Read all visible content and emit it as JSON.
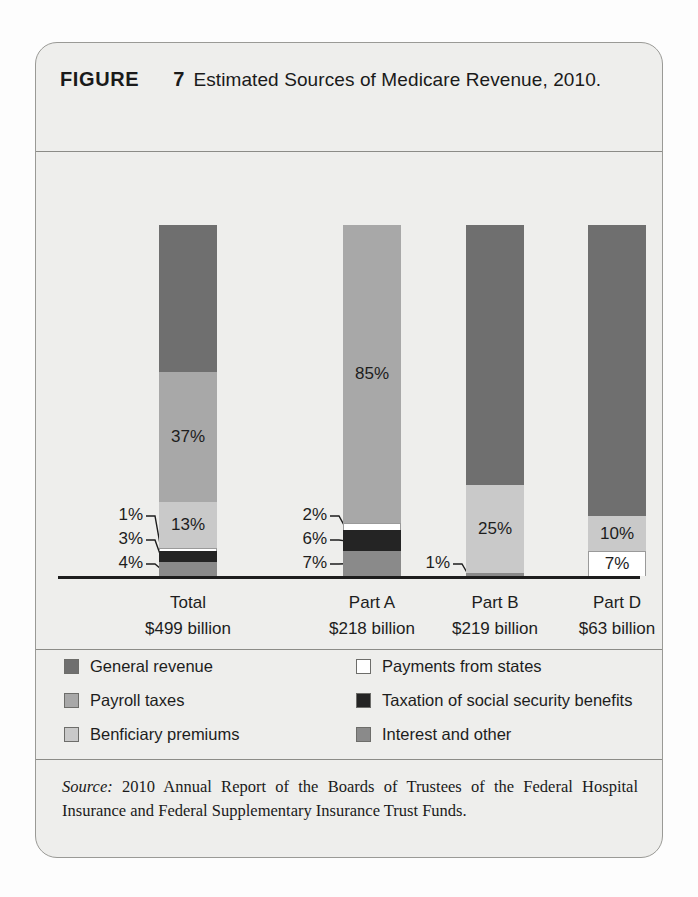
{
  "figure": {
    "label": "FIGURE",
    "number": "7",
    "title": "Estimated Sources of Medicare Revenue, 2010."
  },
  "source": {
    "prefix": "Source:",
    "text": " 2010 Annual Report of the Boards of Trustees of the Federal Hospital Insurance and Federal Supplementary Insurance Trust Funds."
  },
  "colors": {
    "general_revenue": "#6f6f6f",
    "payroll_taxes": "#a8a8a8",
    "beneficiary_premiums": "#c9c9c9",
    "payments_from_states": "#ffffff",
    "taxation_ss_benefits": "#242424",
    "interest_and_other": "#8a8a8a",
    "card_bg": "#eeeeec",
    "axis": "#1d1d1d"
  },
  "legend": {
    "items": [
      {
        "label": "General revenue",
        "color_key": "general_revenue"
      },
      {
        "label": "Payroll taxes",
        "color_key": "payroll_taxes"
      },
      {
        "label": "Benficiary premiums",
        "color_key": "beneficiary_premiums"
      },
      {
        "label": "Payments from states",
        "color_key": "payments_from_states"
      },
      {
        "label": "Taxation of social security benefits",
        "color_key": "taxation_ss_benefits"
      },
      {
        "label": "Interest and other",
        "color_key": "interest_and_other"
      }
    ]
  },
  "chart_data": {
    "type": "bar",
    "subtype": "stacked-100-percent",
    "title": "Estimated Sources of Medicare Revenue, 2010.",
    "xlabel": "",
    "ylabel": "Share of revenue (%)",
    "ylim": [
      0,
      100
    ],
    "grid": false,
    "legend_position": "below-plot",
    "units": "percent",
    "categories": [
      "Total",
      "Part A",
      "Part B",
      "Part D"
    ],
    "category_sublabels": [
      "$499 billion",
      "$218 billion",
      "$219 billion",
      "$63 billion"
    ],
    "series": [
      {
        "name": "General revenue",
        "values": [
          42,
          0,
          74,
          83
        ]
      },
      {
        "name": "Payroll taxes",
        "values": [
          37,
          85,
          0,
          0
        ]
      },
      {
        "name": "Benficiary premiums",
        "values": [
          13,
          0,
          25,
          10
        ]
      },
      {
        "name": "Payments from states",
        "values": [
          1,
          2,
          0,
          7
        ]
      },
      {
        "name": "Taxation of social security benefits",
        "values": [
          3,
          6,
          0,
          0
        ]
      },
      {
        "name": "Interest and other",
        "values": [
          4,
          7,
          1,
          0
        ]
      }
    ],
    "bars": [
      {
        "category": "Total",
        "sublabel": "$499 billion",
        "segments": [
          {
            "series": "Interest and other",
            "value": 4,
            "label": "4%",
            "label_style": "callout"
          },
          {
            "series": "Taxation of social security benefits",
            "value": 3,
            "label": "3%",
            "label_style": "callout"
          },
          {
            "series": "Payments from states",
            "value": 1,
            "label": "1%",
            "label_style": "callout"
          },
          {
            "series": "Benficiary premiums",
            "value": 13,
            "label": "13%",
            "label_style": "inside"
          },
          {
            "series": "Payroll taxes",
            "value": 37,
            "label": "37%",
            "label_style": "inside"
          },
          {
            "series": "General revenue",
            "value": 42,
            "label": "",
            "label_style": "none"
          }
        ]
      },
      {
        "category": "Part A",
        "sublabel": "$218 billion",
        "segments": [
          {
            "series": "Interest and other",
            "value": 7,
            "label": "7%",
            "label_style": "callout"
          },
          {
            "series": "Taxation of social security benefits",
            "value": 6,
            "label": "6%",
            "label_style": "callout"
          },
          {
            "series": "Payments from states",
            "value": 2,
            "label": "2%",
            "label_style": "callout"
          },
          {
            "series": "Payroll taxes",
            "value": 85,
            "label": "85%",
            "label_style": "inside"
          }
        ]
      },
      {
        "category": "Part B",
        "sublabel": "$219 billion",
        "segments": [
          {
            "series": "Interest and other",
            "value": 1,
            "label": "1%",
            "label_style": "callout"
          },
          {
            "series": "Benficiary premiums",
            "value": 25,
            "label": "25%",
            "label_style": "inside"
          },
          {
            "series": "General revenue",
            "value": 74,
            "label": "",
            "label_style": "none"
          }
        ]
      },
      {
        "category": "Part D",
        "sublabel": "$63 billion",
        "segments": [
          {
            "series": "Payments from states",
            "value": 7,
            "label": "7%",
            "label_style": "inside"
          },
          {
            "series": "Benficiary premiums",
            "value": 10,
            "label": "10%",
            "label_style": "inside"
          },
          {
            "series": "General revenue",
            "value": 83,
            "label": "",
            "label_style": "none"
          }
        ]
      }
    ],
    "callouts": [
      {
        "bar": "Total",
        "label": "1%"
      },
      {
        "bar": "Total",
        "label": "3%"
      },
      {
        "bar": "Total",
        "label": "4%"
      },
      {
        "bar": "Part A",
        "label": "2%"
      },
      {
        "bar": "Part A",
        "label": "6%"
      },
      {
        "bar": "Part A",
        "label": "7%"
      },
      {
        "bar": "Part B",
        "label": "1%"
      }
    ]
  }
}
